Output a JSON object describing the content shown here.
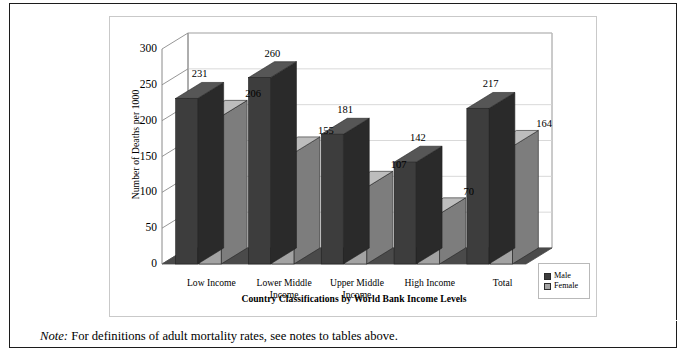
{
  "figure": {
    "note_label": "Note:",
    "note_text": "For definitions of adult mortality rates, see notes to tables above."
  },
  "legend": {
    "items": [
      {
        "label": "Male",
        "color": "#3d3d3d"
      },
      {
        "label": "Female",
        "color": "#a3a3a3"
      }
    ]
  },
  "colors": {
    "male_face": "#3d3d3d",
    "male_side": "#2a2a2a",
    "male_top": "#565656",
    "female_face": "#a3a3a3",
    "female_side": "#7d7d7d",
    "female_top": "#bdbdbd",
    "floor": "#4a4a4a",
    "gridline": "#d5d5d5",
    "axis": "#8a8a8a",
    "frame": "#1c1c1c"
  },
  "chart_data": {
    "type": "bar",
    "title": "",
    "xlabel": "Country Classifications by World Bank Income Levels",
    "ylabel": "Number of Deaths per 1000",
    "ylim": [
      0,
      300
    ],
    "ytick_step": 50,
    "yticks": [
      0,
      50,
      100,
      150,
      200,
      250,
      300
    ],
    "ytick_labels": [
      "0",
      "50",
      "100",
      "150",
      "200",
      "250",
      "300"
    ],
    "grid": true,
    "legend_position": "right",
    "three_d": true,
    "categories": [
      "Low Income",
      "Lower Middle Income",
      "Upper Middle Income",
      "High Income",
      "Total"
    ],
    "category_lines": [
      [
        "Low Income"
      ],
      [
        "Lower Middle",
        "Income"
      ],
      [
        "Upper Middle",
        "Income"
      ],
      [
        "High Income"
      ],
      [
        "Total"
      ]
    ],
    "series": [
      {
        "name": "Male",
        "values": [
          231,
          260,
          181,
          142,
          217
        ]
      },
      {
        "name": "Female",
        "values": [
          206,
          155,
          107,
          70,
          164
        ]
      }
    ]
  }
}
